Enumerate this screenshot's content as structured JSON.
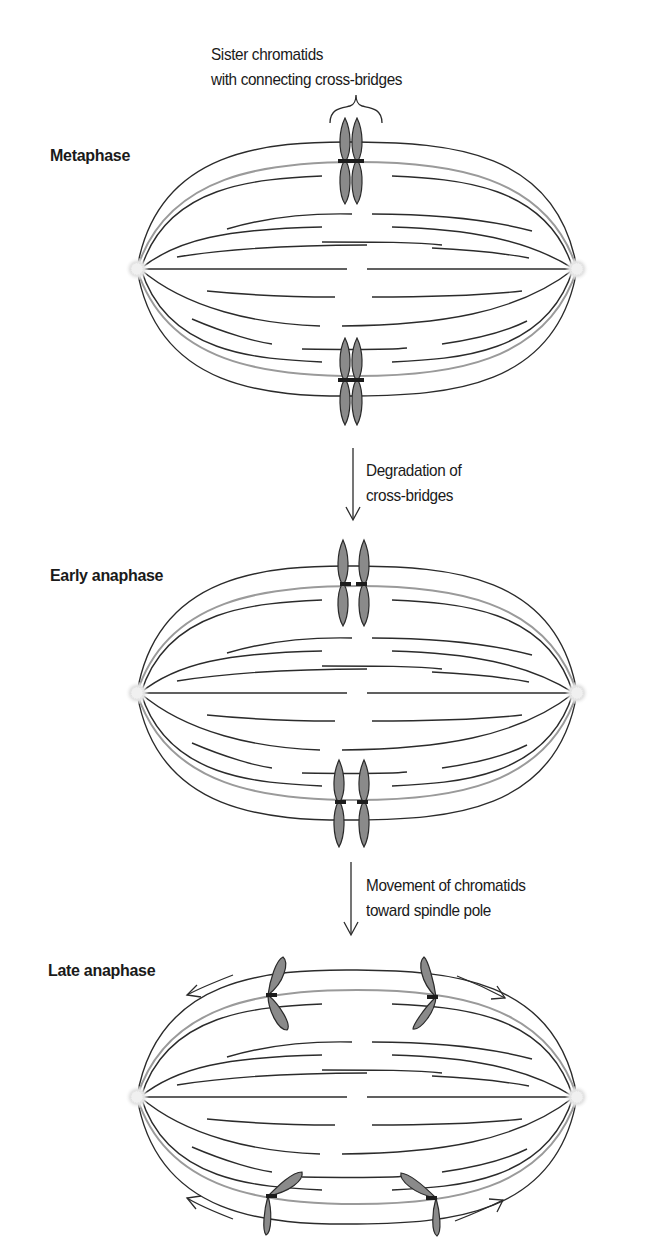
{
  "figure": {
    "stages": [
      {
        "id": "metaphase",
        "label": "Metaphase",
        "annotation": [
          "Sister chromatids",
          "with connecting cross-bridges"
        ],
        "chromatid_state": "paired with cross-bridges"
      },
      {
        "id": "early-anaphase",
        "label": "Early anaphase",
        "chromatid_state": "cross-bridges degraded, chromatids separated"
      },
      {
        "id": "late-anaphase",
        "label": "Late anaphase",
        "chromatid_state": "chromatids moving toward spindle poles"
      }
    ],
    "transitions": [
      {
        "from": "metaphase",
        "to": "early-anaphase",
        "label": [
          "Degradation of",
          "cross-bridges"
        ]
      },
      {
        "from": "early-anaphase",
        "to": "late-anaphase",
        "label": [
          "Movement of chromatids",
          "toward spindle pole"
        ]
      }
    ],
    "colors": {
      "background": "#ffffff",
      "fiber": "#2b2b2b",
      "kinetochore_fiber": "#9a9a9a",
      "chromatid_fill": "#8a8a8a",
      "chromatid_outline": "#2a2a2a",
      "pole": "#e6e6e6"
    }
  }
}
